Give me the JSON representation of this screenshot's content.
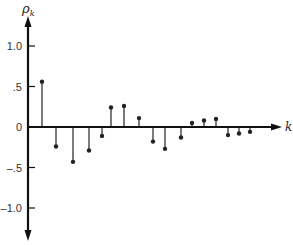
{
  "chart_data": {
    "type": "stem",
    "title": "",
    "xlabel": "k",
    "ylabel": "ρ",
    "ylabel_subscript": "k",
    "ylim": [
      -1.0,
      1.0
    ],
    "yticks": [
      1.0,
      0.5,
      0,
      -0.5,
      -1.0
    ],
    "ytick_labels": [
      "1.0",
      ".5",
      "0",
      "–.5",
      "–1.0"
    ],
    "grid": false,
    "legend": null,
    "x": [
      1,
      2,
      3,
      4,
      5,
      6,
      7,
      8,
      9,
      10,
      11,
      12,
      13,
      14,
      15,
      16,
      17
    ],
    "values": [
      0.56,
      -0.24,
      -0.43,
      -0.29,
      -0.11,
      0.24,
      0.26,
      0.11,
      -0.18,
      -0.27,
      -0.13,
      0.05,
      0.08,
      0.1,
      -0.1,
      -0.08,
      -0.06
    ],
    "stem_px_x": [
      42,
      56,
      73,
      89,
      102,
      111,
      124,
      139,
      153,
      165,
      181,
      192,
      204,
      216,
      228,
      239,
      250
    ]
  },
  "style": {
    "axis_color": "#111111",
    "stem_color": "#222222",
    "text_color": "#333333"
  }
}
